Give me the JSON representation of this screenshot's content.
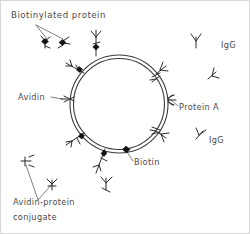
{
  "figure": {
    "type": "scientific-schematic",
    "background_color": "#ffffff",
    "ink_color": "#2b2b2b",
    "label_color": "#4a4a4a",
    "frame_color": "#d8d8d8"
  },
  "labels": {
    "biotinylated_protein": "Biotinylated  protein",
    "avidin": "Avidin",
    "protein_a": "Protein A",
    "biotin": "Biotin",
    "igg_upper": "IgG",
    "igg_lower": "IgG",
    "conjugate_line1": "Avidin-protein",
    "conjugate_line2": "conjugate"
  },
  "icons": {
    "cell_membrane": "double-ring-circle",
    "antibody": "y-shaped-antibody-icon",
    "biotin_marker": "black-diamond-icon",
    "avidin_marker": "cross-shaped-avidin-icon",
    "protein_a_marker": "c-clamp-icon"
  },
  "elements": {
    "membrane_ring": {
      "center_x": 119,
      "center_y": 104,
      "outer_radius": 49,
      "inner_radius": 46
    },
    "free_antibodies": 2,
    "bound_antibodies": 8,
    "biotin_markers": 5,
    "avidin_markers": 5
  }
}
